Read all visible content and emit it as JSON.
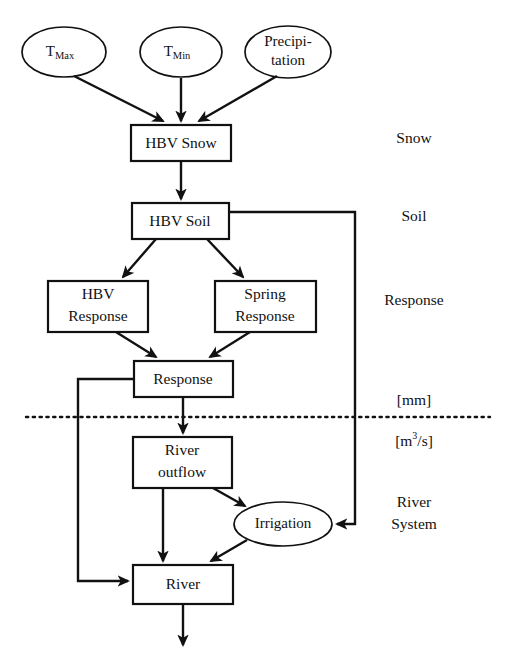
{
  "diagram": {
    "colors": {
      "stroke": "#111111",
      "background": "#ffffff"
    },
    "inputs": [
      {
        "id": "tmax",
        "label": "T",
        "subscript": "Max",
        "shape": "ellipse"
      },
      {
        "id": "tmin",
        "label": "T",
        "subscript": "Min",
        "shape": "ellipse"
      },
      {
        "id": "precipitation",
        "line1": "Precipi-",
        "line2": "tation",
        "shape": "ellipse"
      }
    ],
    "boxes": [
      {
        "id": "hbv-snow",
        "line1": "HBV Snow"
      },
      {
        "id": "hbv-soil",
        "line1": "HBV Soil"
      },
      {
        "id": "hbv-response",
        "line1": "HBV",
        "line2": "Response"
      },
      {
        "id": "spring-response",
        "line1": "Spring",
        "line2": "Response"
      },
      {
        "id": "response",
        "line1": "Response"
      },
      {
        "id": "river-outflow",
        "line1": "River",
        "line2": "outflow"
      },
      {
        "id": "river",
        "line1": "River"
      }
    ],
    "ellipses": [
      {
        "id": "irrigation",
        "label": "Irrigation"
      }
    ],
    "side_labels": [
      {
        "id": "snow",
        "text": "Snow"
      },
      {
        "id": "soil",
        "text": "Soil"
      },
      {
        "id": "response",
        "text": "Response"
      },
      {
        "id": "unit-mm",
        "text": "[mm]"
      },
      {
        "id": "unit-m3s",
        "prefix": "[m",
        "superscript": "3",
        "suffix": "/s]"
      },
      {
        "id": "river-system-line1",
        "text": "River"
      },
      {
        "id": "river-system-line2",
        "text": "System"
      }
    ],
    "divider": {
      "id": "unit-divider",
      "style": "dotted",
      "above_unit": "[mm]",
      "below_unit": "[m3/s]"
    }
  }
}
